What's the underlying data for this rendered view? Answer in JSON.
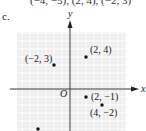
{
  "header": {
    "top_text": "(−4, −5), (2, 4), (−2, 3)",
    "part_label": "c."
  },
  "plot": {
    "x_axis_label": "x",
    "y_axis_label": "y",
    "origin_label": "O",
    "grid_color": "#e6e6e6",
    "axis_color": "#222222",
    "points": [
      {
        "x": -2,
        "y": 3,
        "label": "(−2, 3)"
      },
      {
        "x": 2,
        "y": 4,
        "label": "(2, 4)"
      },
      {
        "x": 2,
        "y": -1,
        "label": "(2, −1)"
      },
      {
        "x": 4,
        "y": -2,
        "label": "(4, −2)"
      },
      {
        "x": -4,
        "y": -5,
        "label": ""
      }
    ]
  }
}
